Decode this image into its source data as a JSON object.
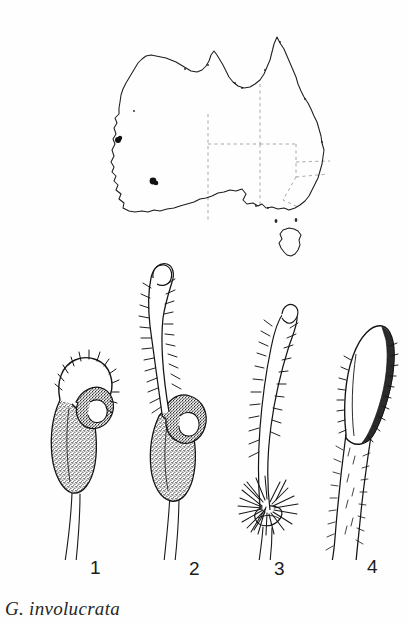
{
  "plate": {
    "caption": "G. involucrata",
    "ink_color": "#1a1a1a",
    "background_color": "#ffffff",
    "boundary_color": "#9a9a9a"
  },
  "map": {
    "name": "australia-distribution-map",
    "region_label": "Australia",
    "boundary_style": "dashed",
    "occurrence_dots": [
      {
        "x": 118,
        "y": 140
      },
      {
        "x": 153,
        "y": 181
      }
    ]
  },
  "figures": [
    {
      "number": "1",
      "label": "flower with hooded labellum, lateral view"
    },
    {
      "number": "2",
      "label": "flower with elongate hairy appendage"
    },
    {
      "number": "3",
      "label": "bract with dense basal hair tuft"
    },
    {
      "number": "4",
      "label": "leaf apex, lanceolate with marginal hairs"
    }
  ]
}
